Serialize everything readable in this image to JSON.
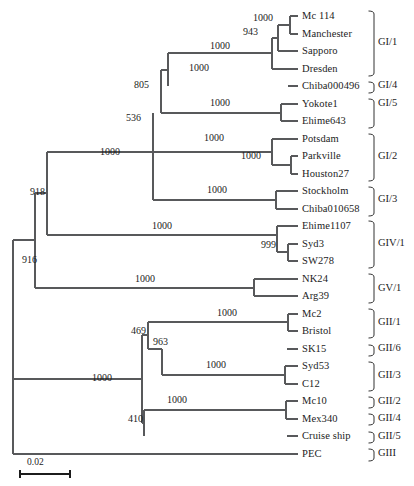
{
  "figure": {
    "type": "phylogenetic-tree",
    "orientation": "left-to-right",
    "scale_bar": {
      "label": "0.02",
      "x": 22,
      "y": 466,
      "length": 50
    },
    "line_color": "#58595b",
    "text_color": "#1c1c1c"
  },
  "chart_data": {
    "type": "table",
    "title": "",
    "xlabel": "",
    "ylabel": "",
    "taxa": [
      {
        "name": "Mc 114",
        "y": 16,
        "branch_x": 290,
        "group": "GI/1"
      },
      {
        "name": "Manchester",
        "y": 34,
        "branch_x": 290,
        "group": "GI/1"
      },
      {
        "name": "Sapporo",
        "y": 51,
        "branch_x": 278,
        "group": "GI/1"
      },
      {
        "name": "Dresden",
        "y": 69,
        "branch_x": 272,
        "group": "GI/1"
      },
      {
        "name": "Chiba000496",
        "y": 86,
        "branch_x": 288,
        "group": "GI/4"
      },
      {
        "name": "Yokote1",
        "y": 104,
        "branch_x": 281,
        "group": "GI/5"
      },
      {
        "name": "Ehime643",
        "y": 121,
        "branch_x": 281,
        "group": "GI/5"
      },
      {
        "name": "Potsdam",
        "y": 139,
        "branch_x": 272,
        "group": "GI/2"
      },
      {
        "name": "Parkville",
        "y": 156,
        "branch_x": 291,
        "group": "GI/2"
      },
      {
        "name": "Houston27",
        "y": 174,
        "branch_x": 291,
        "group": "GI/2"
      },
      {
        "name": "Stockholm",
        "y": 191,
        "branch_x": 276,
        "group": "GI/3"
      },
      {
        "name": "Chiba010658",
        "y": 209,
        "branch_x": 276,
        "group": "GI/3"
      },
      {
        "name": "Ehime1107",
        "y": 226,
        "branch_x": 277,
        "group": "GIV/1"
      },
      {
        "name": "Syd3",
        "y": 244,
        "branch_x": 288,
        "group": "GIV/1"
      },
      {
        "name": "SW278",
        "y": 261,
        "branch_x": 288,
        "group": "GIV/1"
      },
      {
        "name": "NK24",
        "y": 279,
        "branch_x": 254,
        "group": "GV/1"
      },
      {
        "name": "Arg39",
        "y": 296,
        "branch_x": 254,
        "group": "GV/1"
      },
      {
        "name": "Mc2",
        "y": 314,
        "branch_x": 288,
        "group": "GII/1"
      },
      {
        "name": "Bristol",
        "y": 331,
        "branch_x": 288,
        "group": "GII/1"
      },
      {
        "name": "SK15",
        "y": 349,
        "branch_x": 287,
        "group": "GII/6"
      },
      {
        "name": "Syd53",
        "y": 366,
        "branch_x": 285,
        "group": "GII/3"
      },
      {
        "name": "C12",
        "y": 384,
        "branch_x": 285,
        "group": "GII/3"
      },
      {
        "name": "Mc10",
        "y": 401,
        "branch_x": 286,
        "group": "GII/2"
      },
      {
        "name": "Mex340",
        "y": 419,
        "branch_x": 286,
        "group": "GII/4"
      },
      {
        "name": "Cruise ship",
        "y": 436,
        "branch_x": 287,
        "group": "GII/5"
      },
      {
        "name": "PEC",
        "y": 454,
        "branch_x": 287,
        "group": "GIII"
      }
    ],
    "bootstrap_values": [
      {
        "value": "1000",
        "x": 253,
        "y": 13,
        "node": "Mc114-Manchester"
      },
      {
        "value": "943",
        "x": 243,
        "y": 27,
        "node": "GI1-inner"
      },
      {
        "value": "1000",
        "x": 210,
        "y": 41,
        "node": "GI1-outer"
      },
      {
        "value": "1000",
        "x": 189,
        "y": 63,
        "node": "GI1-clade"
      },
      {
        "value": "805",
        "x": 134,
        "y": 80,
        "node": "GI1-GI4"
      },
      {
        "value": "1000",
        "x": 210,
        "y": 98,
        "node": "GI5"
      },
      {
        "value": "536",
        "x": 126,
        "y": 113,
        "node": "GI-upper"
      },
      {
        "value": "1000",
        "x": 204,
        "y": 133,
        "node": "GI2"
      },
      {
        "value": "1000",
        "x": 241,
        "y": 151,
        "node": "GI2-inner"
      },
      {
        "value": "1000",
        "x": 100,
        "y": 147,
        "node": "GI-root"
      },
      {
        "value": "1000",
        "x": 207,
        "y": 185,
        "node": "GI3"
      },
      {
        "value": "918",
        "x": 30,
        "y": 187,
        "node": "GI-GIV"
      },
      {
        "value": "1000",
        "x": 152,
        "y": 221,
        "node": "GIV1"
      },
      {
        "value": "999",
        "x": 261,
        "y": 240,
        "node": "GIV1-inner"
      },
      {
        "value": "916",
        "x": 22,
        "y": 255,
        "node": "GI-GIV-GV"
      },
      {
        "value": "1000",
        "x": 135,
        "y": 274,
        "node": "GV1"
      },
      {
        "value": "1000",
        "x": 217,
        "y": 308,
        "node": "GII1"
      },
      {
        "value": "469",
        "x": 131,
        "y": 326,
        "node": "GII-upper"
      },
      {
        "value": "963",
        "x": 153,
        "y": 337,
        "node": "GII-963"
      },
      {
        "value": "1000",
        "x": 206,
        "y": 360,
        "node": "GII3"
      },
      {
        "value": "1000",
        "x": 92,
        "y": 373,
        "node": "GII-root"
      },
      {
        "value": "1000",
        "x": 167,
        "y": 395,
        "node": "GII2-GII4"
      },
      {
        "value": "410",
        "x": 128,
        "y": 414,
        "node": "GII-lower"
      }
    ],
    "groups": [
      {
        "label": "GI/1",
        "top": 10,
        "bottom": 75,
        "label_y": 37
      },
      {
        "label": "GI/4",
        "top": 81,
        "bottom": 92,
        "label_y": 80
      },
      {
        "label": "GI/5",
        "top": 98,
        "bottom": 127,
        "label_y": 98
      },
      {
        "label": "GI/2",
        "top": 133,
        "bottom": 180,
        "label_y": 151
      },
      {
        "label": "GI/3",
        "top": 186,
        "bottom": 215,
        "label_y": 194
      },
      {
        "label": "GIV/1",
        "top": 220,
        "bottom": 267,
        "label_y": 238
      },
      {
        "label": "GV/1",
        "top": 273,
        "bottom": 302,
        "label_y": 283
      },
      {
        "label": "GII/1",
        "top": 308,
        "bottom": 337,
        "label_y": 317
      },
      {
        "label": "GII/6",
        "top": 344,
        "bottom": 355,
        "label_y": 343
      },
      {
        "label": "GII/3",
        "top": 361,
        "bottom": 390,
        "label_y": 370
      },
      {
        "label": "GII/2",
        "top": 396,
        "bottom": 407,
        "label_y": 396
      },
      {
        "label": "GII/4",
        "top": 413,
        "bottom": 424,
        "label_y": 413
      },
      {
        "label": "GII/5",
        "top": 431,
        "bottom": 442,
        "label_y": 431
      },
      {
        "label": "GIII",
        "top": 448,
        "bottom": 460,
        "label_y": 448
      }
    ]
  }
}
